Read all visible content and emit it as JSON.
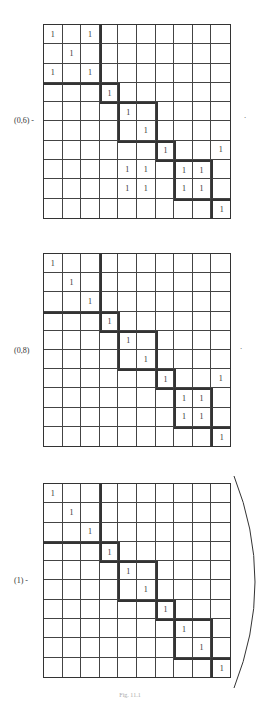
{
  "figures": [
    {
      "label": "(0,6) -",
      "rows": [
        [
          1,
          0,
          1,
          0,
          0,
          0,
          0,
          0,
          0,
          0
        ],
        [
          0,
          1,
          0,
          0,
          0,
          0,
          0,
          0,
          0,
          0
        ],
        [
          1,
          0,
          1,
          0,
          0,
          0,
          0,
          0,
          0,
          0
        ],
        [
          0,
          0,
          0,
          1,
          0,
          0,
          0,
          0,
          0,
          0
        ],
        [
          0,
          0,
          0,
          0,
          1,
          0,
          0,
          0,
          0,
          0
        ],
        [
          0,
          0,
          0,
          0,
          0,
          1,
          0,
          0,
          0,
          0
        ],
        [
          0,
          0,
          0,
          0,
          0,
          0,
          1,
          0,
          0,
          1
        ],
        [
          0,
          0,
          0,
          0,
          1,
          1,
          0,
          1,
          1,
          0
        ],
        [
          0,
          0,
          0,
          0,
          1,
          1,
          0,
          1,
          1,
          0
        ],
        [
          0,
          0,
          0,
          0,
          0,
          0,
          0,
          0,
          0,
          1
        ]
      ],
      "trailing_mark": "·"
    },
    {
      "label": "(0,8)",
      "rows": [
        [
          1,
          0,
          0,
          0,
          0,
          0,
          0,
          0,
          0,
          0
        ],
        [
          0,
          1,
          0,
          0,
          0,
          0,
          0,
          0,
          0,
          0
        ],
        [
          0,
          0,
          1,
          0,
          0,
          0,
          0,
          0,
          0,
          0
        ],
        [
          0,
          0,
          0,
          1,
          0,
          0,
          0,
          0,
          0,
          0
        ],
        [
          0,
          0,
          0,
          0,
          1,
          0,
          0,
          0,
          0,
          0
        ],
        [
          0,
          0,
          0,
          0,
          0,
          1,
          0,
          0,
          0,
          0
        ],
        [
          0,
          0,
          0,
          0,
          0,
          0,
          1,
          0,
          0,
          1
        ],
        [
          0,
          0,
          0,
          0,
          0,
          0,
          0,
          1,
          1,
          0
        ],
        [
          0,
          0,
          0,
          0,
          0,
          0,
          0,
          1,
          1,
          0
        ],
        [
          0,
          0,
          0,
          0,
          0,
          0,
          0,
          0,
          0,
          1
        ]
      ],
      "trailing_mark": "·"
    },
    {
      "label": "(1) -",
      "rows": [
        [
          1,
          0,
          0,
          0,
          0,
          0,
          0,
          0,
          0,
          0
        ],
        [
          0,
          1,
          0,
          0,
          0,
          0,
          0,
          0,
          0,
          0
        ],
        [
          0,
          0,
          1,
          0,
          0,
          0,
          0,
          0,
          0,
          0
        ],
        [
          0,
          0,
          0,
          1,
          0,
          0,
          0,
          0,
          0,
          0
        ],
        [
          0,
          0,
          0,
          0,
          1,
          0,
          0,
          0,
          0,
          0
        ],
        [
          0,
          0,
          0,
          0,
          0,
          1,
          0,
          0,
          0,
          0
        ],
        [
          0,
          0,
          0,
          0,
          0,
          0,
          1,
          0,
          0,
          0
        ],
        [
          0,
          0,
          0,
          0,
          0,
          0,
          0,
          1,
          0,
          0
        ],
        [
          0,
          0,
          0,
          0,
          0,
          0,
          0,
          0,
          1,
          0
        ],
        [
          0,
          0,
          0,
          0,
          0,
          0,
          0,
          0,
          0,
          1
        ]
      ],
      "trailing_mark": ""
    }
  ],
  "blocks": [
    [
      0,
      2
    ],
    [
      3,
      3
    ],
    [
      4,
      5
    ],
    [
      6,
      6
    ],
    [
      7,
      8
    ],
    [
      9,
      9
    ]
  ],
  "cell_value": "1",
  "caption": "Fig. 11.1"
}
